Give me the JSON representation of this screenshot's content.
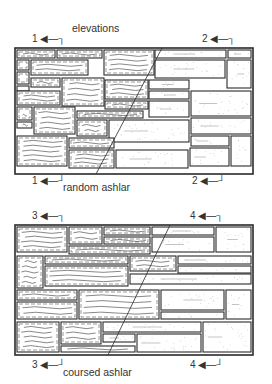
{
  "title": "elevations",
  "walls": [
    {
      "caption": "random ashlar",
      "markers": {
        "top_left": "1",
        "top_right": "2",
        "bottom_left": "1",
        "bottom_right": "2"
      },
      "frame": [
        15,
        48,
        238,
        126
      ],
      "stones": [
        [
          17,
          50,
          38,
          8,
          "t"
        ],
        [
          57,
          50,
          45,
          8,
          "t"
        ],
        [
          104,
          50,
          50,
          25,
          "t"
        ],
        [
          155,
          50,
          71,
          8,
          "s"
        ],
        [
          228,
          50,
          23,
          8,
          "s"
        ],
        [
          17,
          60,
          12,
          10,
          "t"
        ],
        [
          31,
          60,
          57,
          15,
          "t"
        ],
        [
          155,
          60,
          70,
          18,
          "s"
        ],
        [
          227,
          60,
          24,
          28,
          "s"
        ],
        [
          17,
          72,
          12,
          12,
          "t"
        ],
        [
          17,
          86,
          12,
          5,
          "t"
        ],
        [
          31,
          78,
          29,
          9,
          "t"
        ],
        [
          62,
          78,
          42,
          28,
          "t"
        ],
        [
          105,
          80,
          43,
          19,
          "t"
        ],
        [
          149,
          80,
          40,
          9,
          "s"
        ],
        [
          17,
          91,
          43,
          14,
          "t"
        ],
        [
          149,
          91,
          40,
          8,
          "s"
        ],
        [
          191,
          91,
          60,
          25,
          "s"
        ],
        [
          105,
          101,
          43,
          8,
          "t"
        ],
        [
          149,
          101,
          40,
          16,
          "s"
        ],
        [
          17,
          107,
          15,
          13,
          "t"
        ],
        [
          17,
          122,
          15,
          6,
          "t"
        ],
        [
          34,
          107,
          41,
          27,
          "t"
        ],
        [
          77,
          111,
          66,
          7,
          "t"
        ],
        [
          77,
          120,
          30,
          16,
          "t"
        ],
        [
          109,
          120,
          80,
          22,
          "s"
        ],
        [
          191,
          118,
          60,
          16,
          "s"
        ],
        [
          17,
          136,
          50,
          30,
          "t"
        ],
        [
          69,
          138,
          45,
          10,
          "t"
        ],
        [
          191,
          136,
          38,
          10,
          "s"
        ],
        [
          231,
          136,
          20,
          30,
          "s"
        ],
        [
          69,
          150,
          45,
          18,
          "t"
        ],
        [
          116,
          150,
          72,
          18,
          "s"
        ],
        [
          190,
          148,
          39,
          18,
          "s"
        ]
      ],
      "section_line": [
        [
          162,
          48
        ],
        [
          96,
          174
        ]
      ]
    },
    {
      "caption": "coursed ashlar",
      "markers": {
        "top_left": "3",
        "top_right": "4",
        "bottom_left": "4",
        "bottom_right": "4"
      },
      "frame": [
        15,
        225,
        238,
        130
      ],
      "stones": [
        [
          17,
          227,
          50,
          25,
          "t"
        ],
        [
          69,
          227,
          33,
          17,
          "t"
        ],
        [
          104,
          227,
          46,
          8,
          "t"
        ],
        [
          152,
          227,
          62,
          8,
          "s"
        ],
        [
          216,
          227,
          35,
          25,
          "s"
        ],
        [
          104,
          237,
          46,
          7,
          "t"
        ],
        [
          152,
          237,
          62,
          15,
          "s"
        ],
        [
          69,
          246,
          81,
          8,
          "t"
        ],
        [
          17,
          256,
          26,
          32,
          "t"
        ],
        [
          45,
          256,
          83,
          8,
          "t"
        ],
        [
          130,
          256,
          46,
          15,
          "t"
        ],
        [
          178,
          256,
          73,
          8,
          "s"
        ],
        [
          45,
          266,
          83,
          20,
          "t"
        ],
        [
          178,
          266,
          73,
          7,
          "s"
        ],
        [
          130,
          274,
          121,
          10,
          "s"
        ],
        [
          17,
          290,
          60,
          10,
          "t"
        ],
        [
          79,
          290,
          80,
          29,
          "t"
        ],
        [
          161,
          290,
          63,
          20,
          "s"
        ],
        [
          226,
          290,
          25,
          29,
          "s"
        ],
        [
          17,
          302,
          60,
          17,
          "t"
        ],
        [
          161,
          312,
          63,
          7,
          "s"
        ],
        [
          17,
          322,
          42,
          30,
          "t"
        ],
        [
          61,
          322,
          40,
          22,
          "t"
        ],
        [
          103,
          322,
          98,
          10,
          "s"
        ],
        [
          203,
          322,
          48,
          30,
          "s"
        ],
        [
          103,
          334,
          32,
          8,
          "s"
        ],
        [
          137,
          334,
          64,
          18,
          "s"
        ],
        [
          61,
          346,
          74,
          6,
          "t"
        ]
      ],
      "section_line": [
        [
          170,
          225
        ],
        [
          108,
          355
        ]
      ]
    }
  ],
  "colors": {
    "line": "#2a2a2a",
    "texture": "#555555",
    "stipple": "#888888",
    "background": "#ffffff"
  }
}
